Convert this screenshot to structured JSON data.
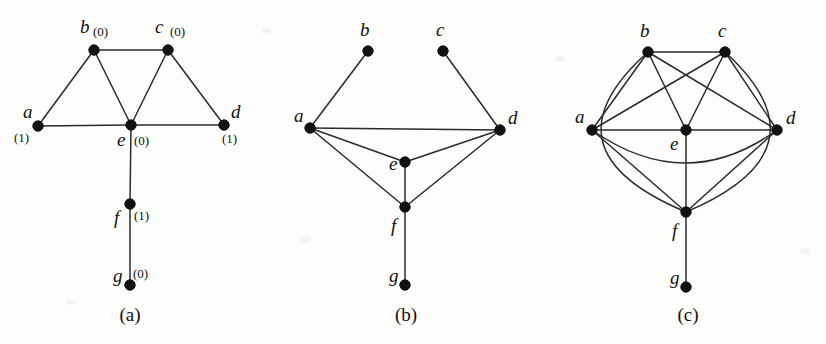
{
  "figure": {
    "background": "#fdfdfc",
    "edge_color": "#2b2b2b",
    "node_color": "#111111",
    "width": 826,
    "height": 344
  },
  "panels": [
    {
      "id": "panel-a",
      "caption": "(a)",
      "caption_x": 130,
      "caption_y": 321,
      "has_weights": true,
      "nodes": [
        {
          "id": "a",
          "label": "a",
          "weight": "(1)",
          "x": 38,
          "y": 126,
          "lx": 23,
          "ly": 118,
          "wx": 14,
          "wy": 142
        },
        {
          "id": "b",
          "label": "b",
          "weight": "(0)",
          "x": 94,
          "y": 50,
          "lx": 80,
          "ly": 33,
          "wx": 93,
          "wy": 36
        },
        {
          "id": "c",
          "label": "c",
          "weight": "(0)",
          "x": 168,
          "y": 50,
          "lx": 155,
          "ly": 33,
          "wx": 170,
          "wy": 36
        },
        {
          "id": "d",
          "label": "d",
          "weight": "(1)",
          "x": 224,
          "y": 125,
          "lx": 231,
          "ly": 118,
          "wx": 222,
          "wy": 143
        },
        {
          "id": "e",
          "label": "e",
          "weight": "(0)",
          "x": 131,
          "y": 125,
          "lx": 117,
          "ly": 146,
          "wx": 134,
          "wy": 145
        },
        {
          "id": "f",
          "label": "f",
          "weight": "(1)",
          "x": 130,
          "y": 204,
          "lx": 114,
          "ly": 224,
          "wx": 134,
          "wy": 220
        },
        {
          "id": "g",
          "label": "g",
          "weight": "(0)",
          "x": 130,
          "y": 285,
          "lx": 113,
          "ly": 282,
          "wx": 133,
          "wy": 278
        }
      ],
      "edges": [
        {
          "from": "b",
          "to": "c",
          "type": "line"
        },
        {
          "from": "a",
          "to": "b",
          "type": "line"
        },
        {
          "from": "b",
          "to": "e",
          "type": "line"
        },
        {
          "from": "c",
          "to": "e",
          "type": "line"
        },
        {
          "from": "c",
          "to": "d",
          "type": "line"
        },
        {
          "from": "a",
          "to": "e",
          "type": "line"
        },
        {
          "from": "e",
          "to": "d",
          "type": "line"
        },
        {
          "from": "e",
          "to": "f",
          "type": "line"
        },
        {
          "from": "f",
          "to": "g",
          "type": "line"
        }
      ]
    },
    {
      "id": "panel-b",
      "caption": "(b)",
      "caption_x": 406,
      "caption_y": 321,
      "has_weights": false,
      "nodes": [
        {
          "id": "a",
          "label": "a",
          "weight": "",
          "x": 310,
          "y": 128,
          "lx": 294,
          "ly": 122,
          "wx": 0,
          "wy": 0
        },
        {
          "id": "b",
          "label": "b",
          "weight": "",
          "x": 368,
          "y": 51,
          "lx": 360,
          "ly": 36,
          "wx": 0,
          "wy": 0
        },
        {
          "id": "c",
          "label": "c",
          "weight": "",
          "x": 443,
          "y": 51,
          "lx": 436,
          "ly": 36,
          "wx": 0,
          "wy": 0
        },
        {
          "id": "d",
          "label": "d",
          "weight": "",
          "x": 500,
          "y": 130,
          "lx": 508,
          "ly": 124,
          "wx": 0,
          "wy": 0
        },
        {
          "id": "e",
          "label": "e",
          "weight": "",
          "x": 405,
          "y": 162,
          "lx": 389,
          "ly": 170,
          "wx": 0,
          "wy": 0
        },
        {
          "id": "f",
          "label": "f",
          "weight": "",
          "x": 405,
          "y": 207,
          "lx": 391,
          "ly": 232,
          "wx": 0,
          "wy": 0
        },
        {
          "id": "g",
          "label": "g",
          "weight": "",
          "x": 405,
          "y": 285,
          "lx": 389,
          "ly": 282,
          "wx": 0,
          "wy": 0
        }
      ],
      "edges": [
        {
          "from": "a",
          "to": "b",
          "type": "line"
        },
        {
          "from": "c",
          "to": "d",
          "type": "line"
        },
        {
          "from": "a",
          "to": "d",
          "type": "line"
        },
        {
          "from": "a",
          "to": "e",
          "type": "line"
        },
        {
          "from": "e",
          "to": "d",
          "type": "line"
        },
        {
          "from": "a",
          "to": "f",
          "type": "line"
        },
        {
          "from": "f",
          "to": "d",
          "type": "line"
        },
        {
          "from": "e",
          "to": "f",
          "type": "line"
        },
        {
          "from": "f",
          "to": "g",
          "type": "line"
        }
      ]
    },
    {
      "id": "panel-c",
      "caption": "(c)",
      "caption_x": 688,
      "caption_y": 321,
      "has_weights": false,
      "nodes": [
        {
          "id": "a",
          "label": "a",
          "weight": "",
          "x": 592,
          "y": 130,
          "lx": 575,
          "ly": 123,
          "wx": 0,
          "wy": 0
        },
        {
          "id": "b",
          "label": "b",
          "weight": "",
          "x": 648,
          "y": 52,
          "lx": 640,
          "ly": 37,
          "wx": 0,
          "wy": 0
        },
        {
          "id": "c",
          "label": "c",
          "weight": "",
          "x": 725,
          "y": 52,
          "lx": 718,
          "ly": 37,
          "wx": 0,
          "wy": 0
        },
        {
          "id": "d",
          "label": "d",
          "weight": "",
          "x": 777,
          "y": 130,
          "lx": 786,
          "ly": 124,
          "wx": 0,
          "wy": 0
        },
        {
          "id": "e",
          "label": "e",
          "weight": "",
          "x": 686,
          "y": 130,
          "lx": 670,
          "ly": 150,
          "wx": 0,
          "wy": 0
        },
        {
          "id": "f",
          "label": "f",
          "weight": "",
          "x": 686,
          "y": 212,
          "lx": 672,
          "ly": 237,
          "wx": 0,
          "wy": 0
        },
        {
          "id": "g",
          "label": "g",
          "weight": "",
          "x": 686,
          "y": 287,
          "lx": 670,
          "ly": 284,
          "wx": 0,
          "wy": 0
        }
      ],
      "edges": [
        {
          "from": "b",
          "to": "c",
          "type": "line"
        },
        {
          "from": "a",
          "to": "b",
          "type": "line"
        },
        {
          "from": "b",
          "to": "e",
          "type": "line"
        },
        {
          "from": "b",
          "to": "d",
          "type": "line"
        },
        {
          "from": "a",
          "to": "c",
          "type": "line"
        },
        {
          "from": "c",
          "to": "e",
          "type": "line"
        },
        {
          "from": "c",
          "to": "d",
          "type": "line"
        },
        {
          "from": "a",
          "to": "e",
          "type": "line"
        },
        {
          "from": "e",
          "to": "d",
          "type": "line"
        },
        {
          "from": "a",
          "to": "f",
          "type": "line"
        },
        {
          "from": "e",
          "to": "f",
          "type": "line"
        },
        {
          "from": "f",
          "to": "d",
          "type": "line"
        },
        {
          "from": "f",
          "to": "g",
          "type": "line"
        },
        {
          "from": "a",
          "to": "d",
          "type": "curve",
          "cx": 686,
          "cy": 196,
          "note": "a-d lower arc passing below e"
        },
        {
          "from": "b",
          "to": "f",
          "type": "curve",
          "cx": 538,
          "cy": 150,
          "note": "b-f outer arc on left"
        },
        {
          "from": "c",
          "to": "f",
          "type": "curve",
          "cx": 832,
          "cy": 150,
          "note": "c-f outer arc on right"
        }
      ]
    }
  ]
}
